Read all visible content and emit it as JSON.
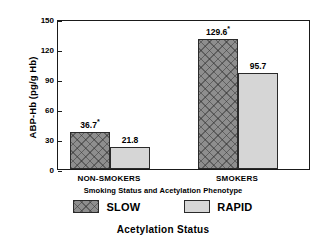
{
  "chart_data": {
    "type": "bar",
    "title": "Acetylation Status",
    "subtitle": "Smoking Status and Acetylation Phenotype",
    "xlabel": "Smoking Status and Acetylation Phenotype",
    "ylabel": "ABP-Hb (pg/g Hb)",
    "categories": [
      "NON-SMOKERS",
      "SMOKERS"
    ],
    "series": [
      {
        "name": "SLOW",
        "values": [
          36.7,
          129.6
        ],
        "labels": [
          "36.7",
          "129.6"
        ],
        "significance": [
          "*",
          "*"
        ],
        "color": "#8e8e8e",
        "pattern": "cross-hatch"
      },
      {
        "name": "RAPID",
        "values": [
          21.8,
          95.7
        ],
        "labels": [
          "21.8",
          "95.7"
        ],
        "significance": [
          "",
          ""
        ],
        "color": "#d6d6d6",
        "pattern": "solid"
      }
    ],
    "ylim": [
      0,
      150
    ],
    "yticks": [
      0,
      30,
      60,
      90,
      120,
      150
    ],
    "ytick_labels": [
      "0",
      "30",
      "60",
      "90",
      "120",
      "150"
    ],
    "grid": false,
    "legend_position": "bottom"
  },
  "axes": {
    "y_title": "ABP-Hb (pg/g Hb)",
    "ticks": [
      {
        "label": "150",
        "value": 150
      },
      {
        "label": "120",
        "value": 120
      },
      {
        "label": "90",
        "value": 90
      },
      {
        "label": "60",
        "value": 60
      },
      {
        "label": "30",
        "value": 30
      },
      {
        "label": "0",
        "value": 0
      }
    ]
  },
  "groups": [
    {
      "label": "NON-SMOKERS",
      "bars": [
        {
          "series": "SLOW",
          "value": 36.7,
          "label": "36.7",
          "sig": "*"
        },
        {
          "series": "RAPID",
          "value": 21.8,
          "label": "21.8",
          "sig": ""
        }
      ]
    },
    {
      "label": "SMOKERS",
      "bars": [
        {
          "series": "SLOW",
          "value": 129.6,
          "label": "129.6",
          "sig": "*"
        },
        {
          "series": "RAPID",
          "value": 95.7,
          "label": "95.7",
          "sig": ""
        }
      ]
    }
  ],
  "legend": [
    {
      "label": "SLOW",
      "style": "slow"
    },
    {
      "label": "RAPID",
      "style": "rapid"
    }
  ],
  "xlabel_inner": "Smoking Status and Acetylation Phenotype",
  "outer_title": "Acetylation Status"
}
